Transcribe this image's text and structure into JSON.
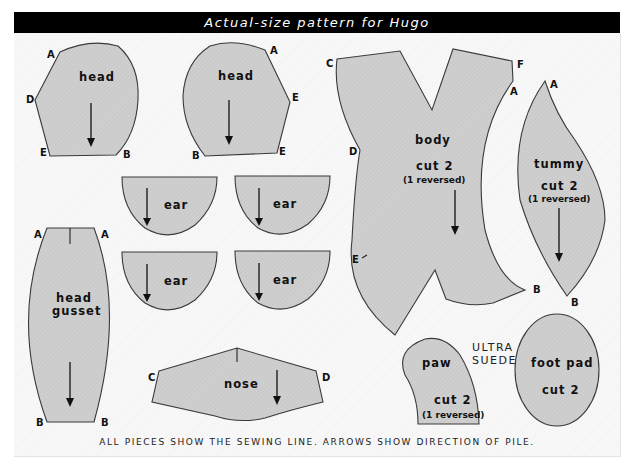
{
  "header": {
    "title": "Actual-size pattern for Hugo"
  },
  "colors": {
    "title_bar": "#000000",
    "sheet": "#f8f8f8",
    "piece_fill": "#cfcfcf",
    "outline": "#3a3a3a"
  },
  "pieces": {
    "head_left": {
      "label": "head",
      "points": {
        "a": "A",
        "d": "D",
        "e": "E",
        "b": "B"
      }
    },
    "head_right": {
      "label": "head",
      "points": {
        "a": "A",
        "e1": "E",
        "e2": "E",
        "b": "B"
      }
    },
    "ears": [
      {
        "label": "ear"
      },
      {
        "label": "ear"
      },
      {
        "label": "ear"
      },
      {
        "label": "ear"
      }
    ],
    "head_gusset": {
      "label_line1": "head",
      "label_line2": "gusset",
      "points": {
        "a1": "A",
        "a2": "A",
        "b1": "B",
        "b2": "B"
      }
    },
    "nose": {
      "label": "nose",
      "points": {
        "c": "C",
        "d": "D"
      }
    },
    "body": {
      "label": "body",
      "cut": "cut 2",
      "note": "(1 reversed)",
      "points": {
        "c": "C",
        "f": "F",
        "a": "A",
        "d": "D",
        "e": "E",
        "b": "B"
      }
    },
    "tummy": {
      "label": "tummy",
      "cut": "cut 2",
      "note": "(1 reversed)",
      "points": {
        "a": "A",
        "b": "B"
      }
    },
    "paw": {
      "label": "paw",
      "cut": "cut 2",
      "note": "(1 reversed)"
    },
    "foot_pad": {
      "label": "foot pad",
      "cut": "cut 2"
    }
  },
  "material_note": {
    "line1": "ULTRA",
    "line2": "SUEDE"
  },
  "footer": {
    "text": "ALL PIECES SHOW THE SEWING LINE. ARROWS SHOW DIRECTION OF PILE."
  }
}
